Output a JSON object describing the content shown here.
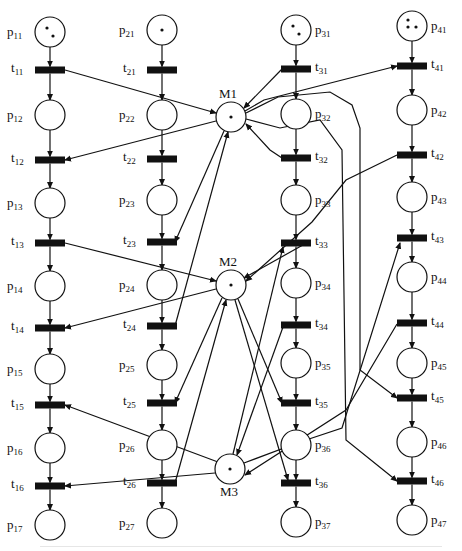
{
  "colors": {
    "ink": "#111111",
    "background": "#ffffff"
  },
  "chains": [
    {
      "id": 1,
      "places": [
        "p11",
        "p12",
        "p13",
        "p14",
        "p15",
        "p16",
        "p17"
      ],
      "transitions": [
        "t11",
        "t12",
        "t13",
        "t14",
        "t15",
        "t16"
      ],
      "initial_tokens": 2
    },
    {
      "id": 2,
      "places": [
        "p21",
        "p22",
        "p23",
        "p24",
        "p25",
        "p26",
        "p27"
      ],
      "transitions": [
        "t21",
        "t22",
        "t23",
        "t24",
        "t25",
        "t26"
      ],
      "initial_tokens": 1
    },
    {
      "id": 3,
      "places": [
        "p31",
        "p32",
        "p33",
        "p34",
        "p35",
        "p36",
        "p37"
      ],
      "transitions": [
        "t31",
        "t32",
        "t33",
        "t34",
        "t35",
        "t36"
      ],
      "initial_tokens": 2
    },
    {
      "id": 4,
      "places": [
        "p41",
        "p42",
        "p43",
        "p44",
        "p45",
        "p46",
        "p47"
      ],
      "transitions": [
        "t41",
        "t42",
        "t43",
        "t44",
        "t45",
        "t46"
      ],
      "initial_tokens": 3
    }
  ],
  "resources": [
    {
      "name": "M1",
      "tokens": 1
    },
    {
      "name": "M2",
      "tokens": 1
    },
    {
      "name": "M3",
      "tokens": 1
    }
  ],
  "resource_arcs": [
    {
      "from": "t11",
      "to": "M1",
      "note": "release"
    },
    {
      "from": "M1",
      "to": "t12"
    },
    {
      "from": "t13",
      "to": "M2"
    },
    {
      "from": "M2",
      "to": "t14"
    },
    {
      "from": "t15",
      "to": "M3"
    },
    {
      "from": "M3",
      "to": "t16"
    },
    {
      "from": "M1",
      "to": "t23"
    },
    {
      "from": "t24",
      "to": "M1"
    },
    {
      "from": "M2",
      "to": "t25"
    },
    {
      "from": "t26",
      "to": "M2"
    },
    {
      "from": "t31",
      "to": "M1"
    },
    {
      "from": "t32",
      "to": "M1"
    },
    {
      "from": "M1",
      "to": "t45"
    },
    {
      "from": "t33",
      "to": "M2"
    },
    {
      "from": "M2",
      "to": "t35"
    },
    {
      "from": "M3",
      "to": "t33"
    },
    {
      "from": "M2",
      "to": "t36"
    },
    {
      "from": "t34",
      "to": "M3"
    },
    {
      "from": "M1",
      "to": "t41"
    },
    {
      "from": "t42",
      "to": "M2"
    },
    {
      "from": "M3",
      "to": "t43"
    },
    {
      "from": "t44",
      "to": "M3"
    },
    {
      "from": "M1",
      "to": "t46"
    }
  ]
}
